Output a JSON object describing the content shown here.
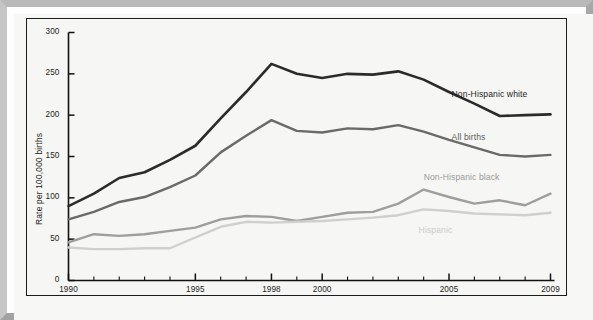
{
  "chart_data": {
    "type": "line",
    "title": "",
    "xlabel": "",
    "ylabel": "Rate per 100,000 births",
    "xlim": [
      1990,
      2009
    ],
    "ylim": [
      0,
      300
    ],
    "yticks": [
      0,
      50,
      100,
      150,
      200,
      250,
      300
    ],
    "ytick_labels": [
      "0",
      "50",
      "100",
      "150",
      "200",
      "250",
      "300"
    ],
    "xticks": [
      1990,
      1991,
      1992,
      1993,
      1994,
      1995,
      1996,
      1997,
      1998,
      1999,
      2000,
      2001,
      2002,
      2003,
      2004,
      2005,
      2006,
      2007,
      2008,
      2009
    ],
    "labeled_xticks": [
      1990,
      1995,
      1998,
      2000,
      2005,
      2009
    ],
    "xtick_labels": [
      "1990",
      "1995",
      "1998",
      "2000",
      "2005",
      "2009"
    ],
    "grid": false,
    "legend_position": "inline-right",
    "x": [
      1990,
      1991,
      1992,
      1993,
      1994,
      1995,
      1996,
      1997,
      1998,
      1999,
      2000,
      2001,
      2002,
      2003,
      2004,
      2005,
      2006,
      2007,
      2008,
      2009
    ],
    "series": [
      {
        "name": "Non-Hispanic white",
        "color": "#2b2b2b",
        "width": 2.6,
        "label_color": "#262626",
        "values": [
          90,
          105,
          124,
          131,
          146,
          163,
          196,
          228,
          262,
          250,
          245,
          250,
          249,
          253,
          243,
          228,
          214,
          199,
          200,
          201
        ]
      },
      {
        "name": "All births",
        "color": "#6a6a6a",
        "width": 2.4,
        "label_color": "#5d5d5d",
        "values": [
          74,
          83,
          95,
          101,
          113,
          127,
          155,
          175,
          194,
          181,
          179,
          184,
          183,
          188,
          180,
          170,
          161,
          152,
          150,
          152
        ]
      },
      {
        "name": "Non-Hispanic black",
        "color": "#9e9e9e",
        "width": 2.4,
        "label_color": "#9a9a9a",
        "values": [
          46,
          56,
          54,
          56,
          60,
          64,
          74,
          78,
          77,
          72,
          77,
          82,
          83,
          93,
          110,
          101,
          93,
          97,
          91,
          105
        ]
      },
      {
        "name": "Hispanic",
        "color": "#cfcfcf",
        "width": 2.4,
        "label_color": "#cccccc",
        "values": [
          40,
          38,
          38,
          39,
          39,
          52,
          65,
          71,
          70,
          71,
          72,
          74,
          76,
          79,
          86,
          84,
          81,
          80,
          79,
          82
        ]
      }
    ],
    "series_label_anchors": [
      {
        "name": "Non-Hispanic white",
        "x": 2005.1,
        "y": 224
      },
      {
        "name": "All births",
        "x": 2005.1,
        "y": 172
      },
      {
        "name": "Non-Hispanic black",
        "x": 2004.0,
        "y": 124
      },
      {
        "name": "Hispanic",
        "x": 2003.8,
        "y": 60
      }
    ]
  },
  "frame": {
    "outer_border_color": "#b4b4b4",
    "chart_border_color": "#1c1c1c",
    "plot_background": "#f6f6f4"
  }
}
